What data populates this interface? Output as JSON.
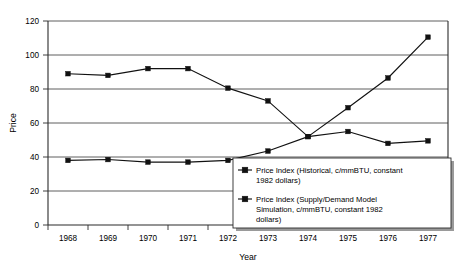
{
  "chart_data": {
    "type": "line",
    "title": "",
    "xlabel": "Year",
    "ylabel": "Price",
    "categories": [
      "1968",
      "1969",
      "1970",
      "1971",
      "1972",
      "1973",
      "1974",
      "1975",
      "1976",
      "1977"
    ],
    "x": [
      1968,
      1969,
      1970,
      1971,
      1972,
      1973,
      1974,
      1975,
      1976,
      1977
    ],
    "xlim": [
      1967.5,
      1977.5
    ],
    "ylim": [
      0,
      120
    ],
    "yticks": [
      0,
      20,
      40,
      60,
      80,
      100,
      120
    ],
    "ytick_labels": [
      "0",
      "20",
      "40",
      "60",
      "80",
      "100",
      "120"
    ],
    "grid": "horizontal",
    "legend_position": "inside-bottom-right",
    "series": [
      {
        "name": "Price Index (Historical, c/mmBTU, constant 1982 dollars)",
        "marker": "filled-square",
        "color": "#111111",
        "values": [
          89,
          88,
          92,
          92,
          80.5,
          73,
          52,
          69,
          86.5,
          110.5
        ]
      },
      {
        "name": "Price Index (Supply/Demand Model Simulation, c/mmBTU, constant 1982 dollars)",
        "marker": "filled-square",
        "color": "#111111",
        "values": [
          38,
          38.5,
          37,
          37,
          38,
          43.5,
          52,
          55,
          48,
          49.5
        ]
      }
    ]
  },
  "legend": {
    "entries": [
      {
        "label": "Price Index (Historical, c/mmBTU, constant 1982 dollars)"
      },
      {
        "label": "Price Index (Supply/Demand Model Simulation, c/mmBTU, constant 1982 dollars)"
      }
    ],
    "lines": [
      [
        "Price Index (Historical, c/mmBTU, constant",
        "1982 dollars)"
      ],
      [
        "Price Index (Supply/Demand Model",
        "Simulation, c/mmBTU, constant 1982",
        "dollars)"
      ]
    ]
  },
  "axes": {
    "y_label": "Price",
    "x_label": "Year",
    "y_ticks": [
      "120",
      "100",
      "80",
      "60",
      "40",
      "20",
      "0"
    ],
    "x_ticks": [
      "1968",
      "1969",
      "1970",
      "1971",
      "1972",
      "1973",
      "1974",
      "1975",
      "1976",
      "1977"
    ]
  }
}
